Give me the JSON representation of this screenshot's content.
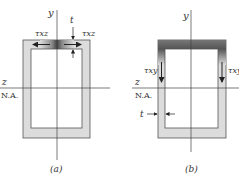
{
  "figure": {
    "type": "thin-walled box section shear stress diagram",
    "colors": {
      "wall_fill": "#dcdcdc",
      "dark_shade": "#555555",
      "line": "#333333",
      "background": "#ffffff"
    },
    "panel_a": {
      "caption": "(a)",
      "y_axis_label": "y",
      "z_axis_label": "z",
      "neutral_axis_label": "N.A.",
      "thickness_label": "t",
      "shear_left_label": "τxz",
      "shear_right_label": "τxz"
    },
    "panel_b": {
      "caption": "(b)",
      "y_axis_label": "y",
      "z_axis_label": "z",
      "neutral_axis_label": "N.A.",
      "thickness_label": "t",
      "shear_left_label": "τxy",
      "shear_right_label": "τxy"
    }
  }
}
